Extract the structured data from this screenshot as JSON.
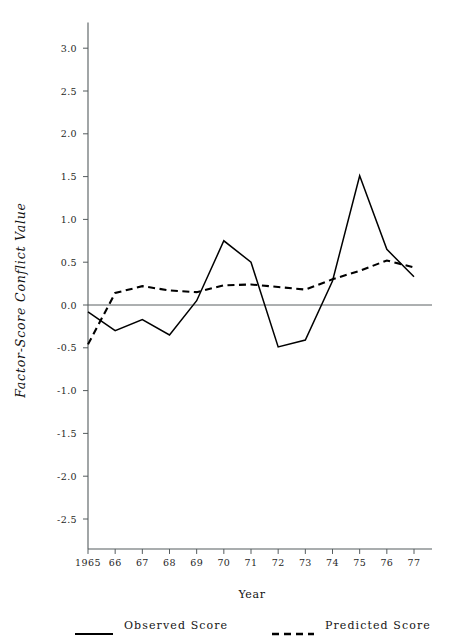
{
  "chart_data": {
    "type": "line",
    "title": "",
    "xlabel": "Year",
    "ylabel": "Factor-Score Conflict Value",
    "x": [
      1965,
      1966,
      1967,
      1968,
      1969,
      1970,
      1971,
      1972,
      1973,
      1974,
      1975,
      1976,
      1977
    ],
    "xtick_labels": [
      "1965",
      "66",
      "67",
      "68",
      "69",
      "70",
      "71",
      "72",
      "73",
      "74",
      "75",
      "76",
      "77"
    ],
    "ytick_labels": [
      "3.0",
      "2.5",
      "2.0",
      "1.5",
      "1.0",
      "0.5",
      "0.0",
      "-0.5",
      "-1.0",
      "-1.5",
      "-2.0",
      "-2.5"
    ],
    "ytick_values": [
      3.0,
      2.5,
      2.0,
      1.5,
      1.0,
      0.5,
      0.0,
      -0.5,
      -1.0,
      -1.5,
      -2.0,
      -2.5
    ],
    "xlim": [
      1965,
      1977
    ],
    "ylim": [
      -2.85,
      3.3
    ],
    "grid": false,
    "zero_reference_line": 0.0,
    "legend_position": "below-bottom",
    "series": [
      {
        "name": "Observed Score",
        "style": "solid",
        "color": "#000000",
        "values": [
          -0.08,
          -0.3,
          -0.17,
          -0.35,
          0.05,
          0.75,
          0.5,
          -0.49,
          -0.41,
          0.28,
          1.51,
          0.65,
          0.33
        ]
      },
      {
        "name": "Predicted Score",
        "style": "dashed",
        "color": "#000000",
        "values": [
          -0.46,
          0.14,
          0.22,
          0.17,
          0.15,
          0.23,
          0.24,
          0.21,
          0.18,
          0.3,
          0.4,
          0.52,
          0.44
        ]
      }
    ]
  },
  "legend": {
    "observed_label": "Observed Score",
    "predicted_label": "Predicted Score"
  }
}
